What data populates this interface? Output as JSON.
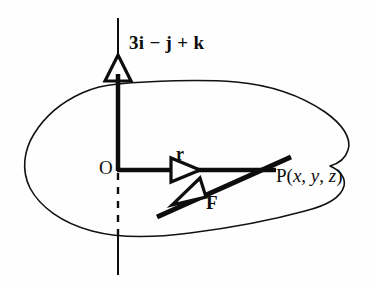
{
  "figure": {
    "name": "moment-of-force-diagram",
    "background_color": "#fefefe",
    "ink_color": "#0d0d0d",
    "width": 372,
    "height": 286
  },
  "labels": {
    "vector_axis": "3i − j + k",
    "origin": "O",
    "position_vector": "r",
    "force_vector": "F",
    "point": {
      "prefix": "P(",
      "x": "x",
      "sep1": ", ",
      "y": "y",
      "sep2": ", ",
      "z": "z",
      "suffix": ")"
    }
  },
  "elements": {
    "blob_outline": "closed-region-boundary",
    "axis_line": "vertical-axis-through-origin",
    "axis_dashed_segment": "hidden-portion-below-origin",
    "axis_arrowhead": "hollow-triangle-up",
    "r_arrowhead": "hollow-triangle-right",
    "force_line": "thick-diagonal-line",
    "force_arrowhead": "hollow-triangle-down-left"
  }
}
